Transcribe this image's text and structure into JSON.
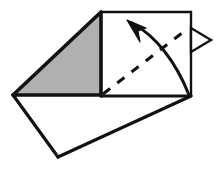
{
  "figure": {
    "type": "origami-step-diagram",
    "canvas": {
      "width": 218,
      "height": 169
    },
    "background_color": "#ffffff"
  },
  "colors": {
    "paper_front": "#ffffff",
    "paper_back_shaded": "#b0b0b0",
    "outline": "#111111",
    "crease_dashed": "#111111",
    "arrow_solid": "#111111",
    "arrow_open_fill": "#ffffff"
  },
  "line_styles": {
    "outline_width": 3.2,
    "thin_outline_width": 2.4,
    "crease_width": 3.0,
    "crease_dash_pattern": "9 9",
    "arrow_curve_width": 3.0,
    "arrow_open_width": 2.4
  },
  "shapes": {
    "shaded_triangle": {
      "name": "shaded-back-triangle",
      "fill": "#b0b0b0",
      "points": "13,95 101,12 101,95"
    },
    "square_panel": {
      "name": "white-square-panel",
      "fill": "#ffffff",
      "points": "101,12 191,12 191,96 101,96"
    },
    "bottom_flap": {
      "name": "white-bottom-flap",
      "fill": "#ffffff",
      "points": "13,95 191,96 58,157"
    }
  },
  "strokes": {
    "shaded_triangle_outline": "M 13,95 L 101,12 L 101,96",
    "square_top_edge": "M 101,12 L 191,12",
    "square_right_edge": "M 191,12 L 191,96",
    "square_bottom_edge": "M 101,96 L 191,96",
    "flap_left_edge": "M 13,95 L 58,157",
    "flap_right_edge": "M 58,157 L 191,96",
    "base_horizontal_edge": "M 13,95 L 101,95"
  },
  "crease": {
    "name": "valley-fold-crease-line",
    "path": "M 103,94 L 186,30",
    "style": "dashed",
    "meaning": "fold line"
  },
  "arrows": {
    "fold_arrow": {
      "name": "fold-direction-arrow",
      "style": "solid-filled-curved",
      "curve_path": "M 189,95 C 176,62 156,36 132,23",
      "head_points": "127,20 146,28 138,31 140,42",
      "direction": "up-left",
      "meaning": "fold the corner over"
    },
    "unfold_arrow": {
      "name": "unfold-return-arrow",
      "style": "open-triangle",
      "head_points": "211,40 191,28 191,52",
      "direction": "right",
      "meaning": "fold and unfold"
    }
  }
}
